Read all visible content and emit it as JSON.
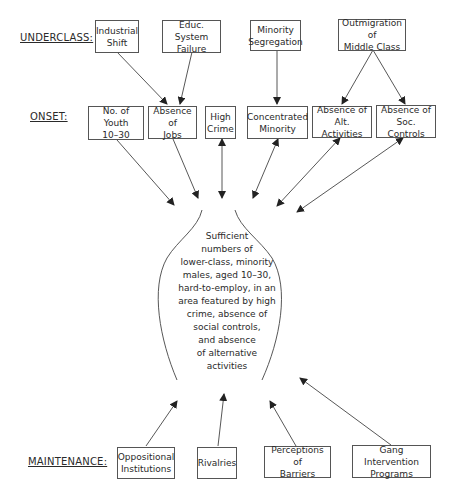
{
  "levels": {
    "underclass": "UNDERCLASS:",
    "onset": "ONSET:",
    "maintenance": "MAINTENANCE:"
  },
  "underclass": [
    {
      "id": "industrial-shift",
      "label": "Industrial\nShift"
    },
    {
      "id": "educ-system-failure",
      "label": "Educ. System\nFailure"
    },
    {
      "id": "minority-segregation",
      "label": "Minority\nSegregation"
    },
    {
      "id": "outmigration-middle-class",
      "label": "Outmigration of\nMiddle Class"
    }
  ],
  "onset": [
    {
      "id": "no-of-youth",
      "label": "No. of Youth\n10–30"
    },
    {
      "id": "absence-of-jobs",
      "label": "Absence of\nJobs"
    },
    {
      "id": "high-crime",
      "label": "High\nCrime"
    },
    {
      "id": "concentrated-minority",
      "label": "Concentrated\nMinority"
    },
    {
      "id": "absence-alt-activities",
      "label": "Absence of\nAlt. Activities"
    },
    {
      "id": "absence-soc-controls",
      "label": "Absence of\nSoc. Controls"
    }
  ],
  "center": {
    "text": "Sufficient\nnumbers of\nlower-class, minority\nmales, aged 10–30,\nhard-to-employ, in an\narea featured by high\ncrime, absence of\nsocial controls,\nand absence\nof alternative\nactivities"
  },
  "maintenance": [
    {
      "id": "oppositional-institutions",
      "label": "Oppositional\nInstitutions"
    },
    {
      "id": "rivalries",
      "label": "Rivalries"
    },
    {
      "id": "perceptions-of-barriers",
      "label": "Perceptions of\nBarriers"
    },
    {
      "id": "gang-intervention-programs",
      "label": "Gang Intervention\nPrograms"
    }
  ],
  "colors": {
    "line": "#444444",
    "box_border": "#555555",
    "text": "#2a2a2a"
  }
}
